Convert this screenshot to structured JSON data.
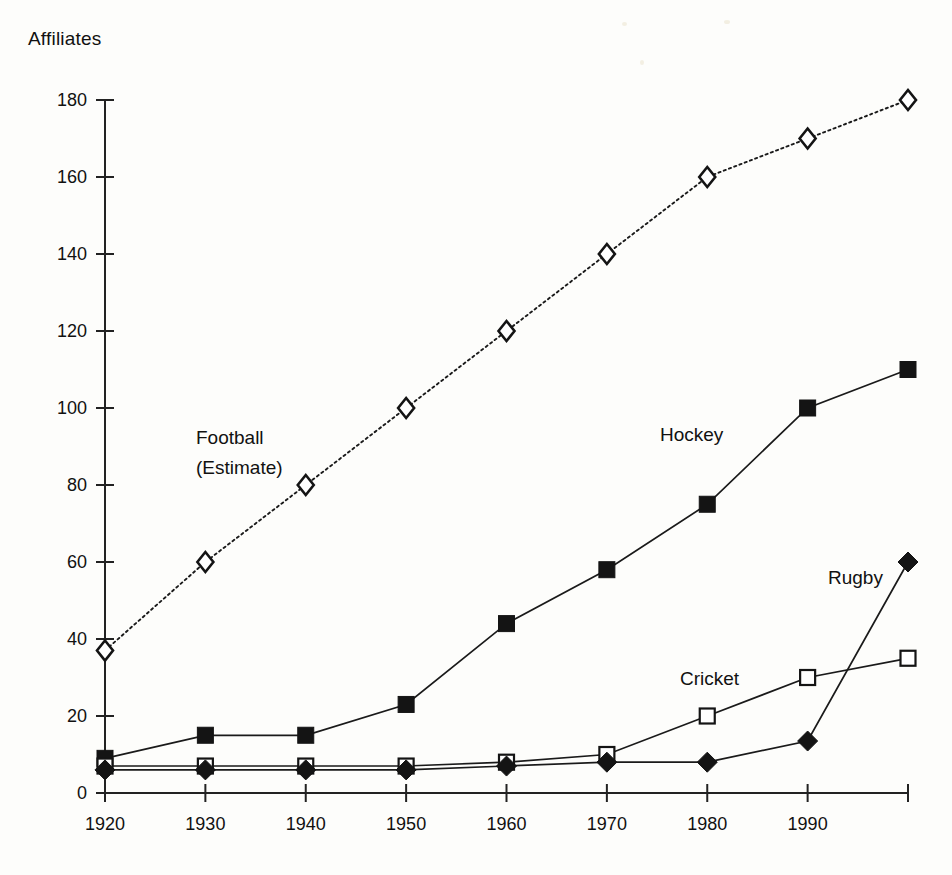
{
  "chart_data": {
    "type": "line",
    "title": "",
    "subtitle": "",
    "xlabel": "",
    "ylabel": "Affiliates",
    "x": [
      1920,
      1930,
      1940,
      1950,
      1960,
      1970,
      1980,
      1990,
      2000
    ],
    "xtick_labels": [
      "1920",
      "1930",
      "1940",
      "1950",
      "1960",
      "1970",
      "1980",
      "1990",
      ""
    ],
    "ytick_labels": [
      "0",
      "20",
      "40",
      "60",
      "80",
      "100",
      "120",
      "140",
      "160",
      "180"
    ],
    "ytick_values": [
      0,
      20,
      40,
      60,
      80,
      100,
      120,
      140,
      160,
      180
    ],
    "xlim": [
      1920,
      2000
    ],
    "ylim": [
      0,
      180
    ],
    "grid": false,
    "legend_position": "inline-annotations",
    "series": [
      {
        "name": "Football (Estimate)",
        "label_lines": [
          "Football",
          "(Estimate)"
        ],
        "marker": "open-diamond",
        "linestyle": "dotted",
        "color": "#141414",
        "values": [
          37,
          60,
          80,
          100,
          120,
          140,
          160,
          170,
          180
        ]
      },
      {
        "name": "Hockey",
        "label_lines": [
          "Hockey"
        ],
        "marker": "filled-square",
        "linestyle": "solid",
        "color": "#141414",
        "values": [
          9,
          15,
          15,
          23,
          44,
          58,
          75,
          100,
          110
        ]
      },
      {
        "name": "Cricket",
        "label_lines": [
          "Cricket"
        ],
        "marker": "open-square",
        "linestyle": "solid",
        "color": "#141414",
        "values": [
          7,
          7,
          7,
          7,
          8,
          10,
          20,
          30,
          35
        ]
      },
      {
        "name": "Rugby",
        "label_lines": [
          "Rugby"
        ],
        "marker": "filled-diamond",
        "linestyle": "solid",
        "color": "#141414",
        "values": [
          6,
          6,
          6,
          6,
          7,
          8,
          8,
          13.5,
          60
        ]
      }
    ],
    "annotations": [
      {
        "text": "Football",
        "x_px": 196,
        "y_px": 444
      },
      {
        "text": "(Estimate)",
        "x_px": 196,
        "y_px": 474
      },
      {
        "text": "Hockey",
        "x_px": 660,
        "y_px": 441
      },
      {
        "text": "Cricket",
        "x_px": 680,
        "y_px": 685
      },
      {
        "text": "Rugby",
        "x_px": 828,
        "y_px": 584
      }
    ]
  },
  "axis_title": "Affiliates"
}
